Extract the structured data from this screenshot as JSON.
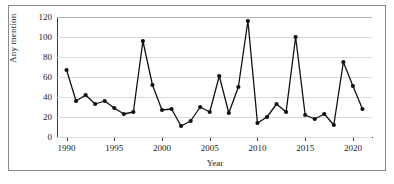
{
  "chart_data": {
    "type": "line",
    "title": "",
    "xlabel": "Year",
    "ylabel": "Any mention",
    "xlim": [
      1989,
      2022
    ],
    "ylim": [
      0,
      120
    ],
    "grid": true,
    "legend": "none",
    "x_ticks": [
      1990,
      1995,
      2000,
      2005,
      2010,
      2015,
      2020
    ],
    "y_ticks": [
      0,
      20,
      40,
      60,
      80,
      100,
      120
    ],
    "marker": "filled-circle",
    "line_color": "#111111",
    "grid_color": "#d9d9d9",
    "x": [
      1990,
      1991,
      1992,
      1993,
      1994,
      1995,
      1996,
      1997,
      1998,
      1999,
      2000,
      2001,
      2002,
      2003,
      2004,
      2005,
      2006,
      2007,
      2008,
      2009,
      2010,
      2011,
      2012,
      2013,
      2014,
      2015,
      2016,
      2017,
      2018,
      2019,
      2020,
      2021
    ],
    "values": [
      67,
      36,
      42,
      33,
      36,
      29,
      23,
      25,
      96,
      52,
      27,
      28,
      11,
      16,
      30,
      25,
      61,
      24,
      50,
      116,
      14,
      20,
      33,
      25,
      100,
      22,
      18,
      23,
      12,
      75,
      51,
      28
    ],
    "series": [
      {
        "name": "Any mention",
        "values": [
          67,
          36,
          42,
          33,
          36,
          29,
          23,
          25,
          96,
          52,
          27,
          28,
          11,
          16,
          30,
          25,
          61,
          24,
          50,
          116,
          14,
          20,
          33,
          25,
          100,
          22,
          18,
          23,
          12,
          75,
          51,
          28
        ]
      }
    ],
    "annotations": []
  }
}
